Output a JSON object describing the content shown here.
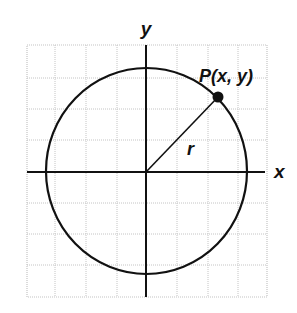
{
  "diagram": {
    "type": "unit-circle-coordinate-plane",
    "labels": {
      "x_axis": "x",
      "y_axis": "y",
      "point": "P(x, y)",
      "radius": "r"
    },
    "grid": {
      "columns": 8,
      "rows": 8
    },
    "colors": {
      "ink": "#111111",
      "grid": "#c4c4c4",
      "background": "#ffffff"
    }
  }
}
